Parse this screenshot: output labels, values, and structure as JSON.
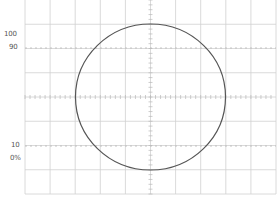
{
  "scope": {
    "grid": {
      "left": 25,
      "right": 276,
      "top": 0,
      "bottom": 194,
      "columns": 10,
      "rows": 8,
      "line_color": "#d0d0d0",
      "axis_color": "#b8b8b8"
    },
    "reference_lines": [
      {
        "label": "100",
        "y": 24,
        "dashed": false
      },
      {
        "label": "90",
        "y": 48,
        "dashed": true
      },
      {
        "label": "10",
        "y": 146,
        "dashed": true
      },
      {
        "label": "0%",
        "y": 170,
        "dashed": false
      }
    ],
    "labels": {
      "l100": "100",
      "l90": "90",
      "l10": "10",
      "l0": "0%"
    },
    "trace": {
      "shape": "circle",
      "center_x": 150.5,
      "center_y": 97,
      "radius_x": 75,
      "radius_y": 73,
      "color": "#555555"
    }
  }
}
